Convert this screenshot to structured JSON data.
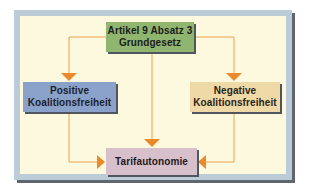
{
  "diagram": {
    "type": "flowchart",
    "colors": {
      "background": "#fdf9df",
      "frame": "#bccbd8",
      "frame_shadow": "#5f6670",
      "connector": "#eba24a",
      "arrowhead": "#ea8a2a",
      "box_top": "#8fb56f",
      "box_left": "#8aa2c9",
      "box_right": "#efd9a6",
      "box_bottom": "#d8bfcc"
    },
    "nodes": {
      "top": {
        "line1": "Artikel 9 Absatz 3",
        "line2": "Grundgesetz"
      },
      "left": {
        "line1": "Positive",
        "line2": "Koalitionsfreiheit"
      },
      "right": {
        "line1": "Negative",
        "line2": "Koalitionsfreiheit"
      },
      "bottom": {
        "line1": "Tarifautonomie"
      }
    },
    "edges": [
      {
        "from": "top",
        "to": "left"
      },
      {
        "from": "top",
        "to": "right"
      },
      {
        "from": "top",
        "to": "bottom"
      },
      {
        "from": "left",
        "to": "bottom"
      },
      {
        "from": "right",
        "to": "bottom"
      }
    ]
  }
}
